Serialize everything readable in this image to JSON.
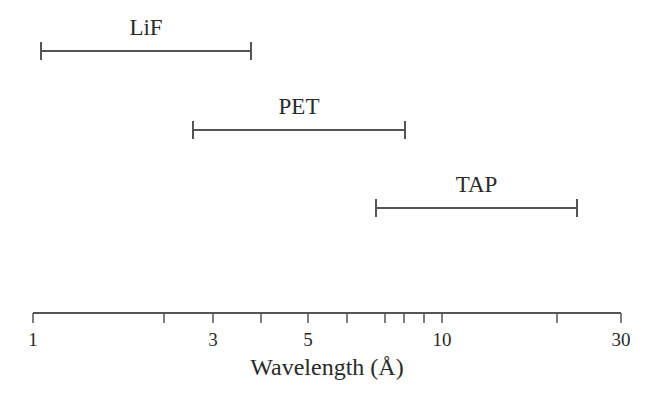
{
  "chart_data": {
    "type": "range",
    "title": "",
    "xlabel": "Wavelength (Å)",
    "ylabel": "",
    "xscale": "log",
    "xlim": [
      1,
      30
    ],
    "grid": false,
    "legend": null,
    "ticks": [
      {
        "value": 1,
        "label": "1",
        "px": 33
      },
      {
        "value": 2,
        "label": "",
        "px": 164
      },
      {
        "value": 3,
        "label": "3",
        "px": 213
      },
      {
        "value": 4,
        "label": "",
        "px": 261
      },
      {
        "value": 5,
        "label": "5",
        "px": 308
      },
      {
        "value": 6,
        "label": "",
        "px": 347
      },
      {
        "value": 7,
        "label": "",
        "px": 385
      },
      {
        "value": 8,
        "label": "",
        "px": 404
      },
      {
        "value": 9,
        "label": "",
        "px": 424
      },
      {
        "value": 10,
        "label": "10",
        "px": 442
      },
      {
        "value": 20,
        "label": "",
        "px": 557
      },
      {
        "value": 30,
        "label": "30",
        "px": 621
      }
    ],
    "series": [
      {
        "name": "LiF",
        "min": 1.05,
        "max": 3.8,
        "x1": 41,
        "x2": 251,
        "y": 51
      },
      {
        "name": "PET",
        "min": 2.6,
        "max": 8.0,
        "x1": 193,
        "x2": 405,
        "y": 130
      },
      {
        "name": "TAP",
        "min": 6.7,
        "max": 24.0,
        "x1": 376,
        "x2": 577,
        "y": 208
      }
    ]
  },
  "colors": {
    "line": "#555555",
    "text": "#2a2a2a"
  }
}
